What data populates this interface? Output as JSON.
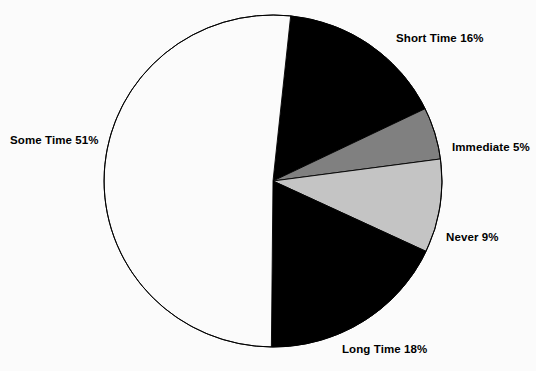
{
  "chart_data": {
    "type": "pie",
    "title": "",
    "subtitle": "",
    "xlabel": "",
    "ylabel": "",
    "legend_position": "none",
    "grid": false,
    "labels_inline": true,
    "start_angle_deg": 6,
    "direction": "clockwise",
    "categories": [
      "Short Time",
      "Immediate",
      "Never",
      "Long Time",
      "Some Time"
    ],
    "values": [
      16,
      5,
      9,
      18,
      51
    ],
    "value_unit": "%",
    "slices": [
      {
        "name": "Short Time",
        "label": "Short Time 16%",
        "value": 16,
        "color": "#000000",
        "stroke": "#000000"
      },
      {
        "name": "Immediate",
        "label": "Immediate 5%",
        "value": 5,
        "color": "#808080",
        "stroke": "#000000"
      },
      {
        "name": "Never",
        "label": "Never 9%",
        "value": 9,
        "color": "#c4c4c4",
        "stroke": "#000000"
      },
      {
        "name": "Long Time",
        "label": "Long Time 18%",
        "value": 18,
        "color": "#000000",
        "stroke": "#000000"
      },
      {
        "name": "Some Time",
        "label": "Some Time 51%",
        "value": 51,
        "color": "#fbfbfb",
        "stroke": "#000000"
      }
    ]
  },
  "geometry": {
    "center_x": 273,
    "center_y": 181,
    "radius_x": 169,
    "radius_y": 166
  },
  "colors": {
    "background": "#fbfbfb",
    "outline": "#000000",
    "text": "#000000",
    "dark_slice": "#000000",
    "mid_gray_slice": "#808080",
    "light_gray_slice": "#c4c4c4",
    "white_slice": "#fbfbfb"
  }
}
